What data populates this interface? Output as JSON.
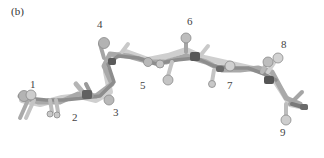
{
  "figure": {
    "panel_label": "(b)",
    "residue_labels": [
      {
        "text": "1",
        "x": 30,
        "y": 79
      },
      {
        "text": "2",
        "x": 72,
        "y": 112
      },
      {
        "text": "3",
        "x": 113,
        "y": 107
      },
      {
        "text": "4",
        "x": 97,
        "y": 19
      },
      {
        "text": "5",
        "x": 140,
        "y": 80
      },
      {
        "text": "6",
        "x": 187,
        "y": 16
      },
      {
        "text": "7",
        "x": 227,
        "y": 80
      },
      {
        "text": "8",
        "x": 281,
        "y": 39
      },
      {
        "text": "9",
        "x": 280,
        "y": 127
      }
    ],
    "colors": {
      "light": "#d4d4d4",
      "mid": "#a8a8a8",
      "dark": "#6e6e6e",
      "darkest": "#505050",
      "outline": "#8a8a8a"
    }
  }
}
